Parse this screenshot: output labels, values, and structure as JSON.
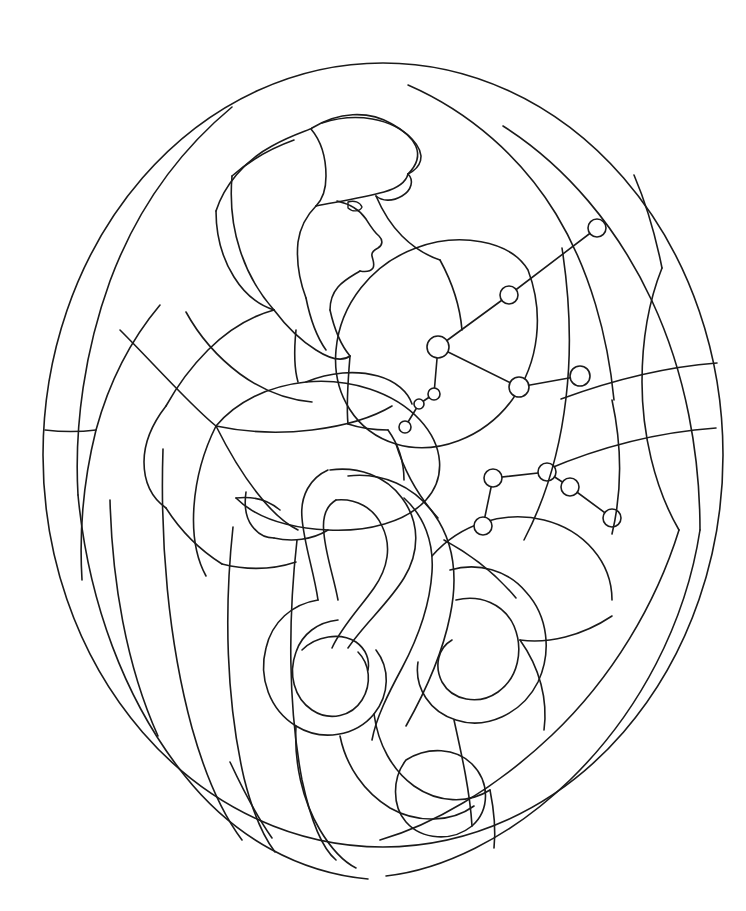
{
  "document": {
    "kind": "line-art-coloring-page",
    "title": "Aquarius Water Bearer Stained Glass Pattern",
    "background_color": "#ffffff",
    "line_color": "#1a1a1a",
    "width": 746,
    "height": 911,
    "subject": "water-bearer-figure-with-constellations"
  },
  "frame": {
    "shape": "oval",
    "center_x": 383,
    "center_y": 455,
    "radius_x": 340,
    "radius_y": 392,
    "left": 43,
    "right": 723,
    "top": 63,
    "bottom": 847,
    "label": "oval-border"
  },
  "figure": {
    "name": "water-bearer",
    "parts": [
      {
        "id": "head-covering",
        "label": "Head covering / cap"
      },
      {
        "id": "face-profile",
        "label": "Face in profile"
      },
      {
        "id": "eye",
        "label": "Eye"
      },
      {
        "id": "hair-back",
        "label": "Hair falling back"
      },
      {
        "id": "shoulder",
        "label": "Shoulder"
      },
      {
        "id": "arm",
        "label": "Arm"
      },
      {
        "id": "torso",
        "label": "Torso / robe"
      },
      {
        "id": "vessel",
        "label": "Water jar / urn"
      },
      {
        "id": "water-stream",
        "label": "Pouring water stream"
      }
    ]
  },
  "constellations": [
    {
      "name": "upper-constellation",
      "label": "Upper constellation",
      "stars": [
        {
          "id": "s1",
          "x": 597,
          "y": 228,
          "r": 9
        },
        {
          "id": "s2",
          "x": 509,
          "y": 295,
          "r": 9
        },
        {
          "id": "s3",
          "x": 438,
          "y": 347,
          "r": 11
        },
        {
          "id": "s4",
          "x": 519,
          "y": 387,
          "r": 10
        },
        {
          "id": "s5",
          "x": 580,
          "y": 376,
          "r": 10
        },
        {
          "id": "s6",
          "x": 434,
          "y": 394,
          "r": 6
        },
        {
          "id": "s7",
          "x": 419,
          "y": 404,
          "r": 5
        },
        {
          "id": "s8",
          "x": 405,
          "y": 427,
          "r": 6
        }
      ],
      "links": [
        [
          "s1",
          "s2"
        ],
        [
          "s2",
          "s3"
        ],
        [
          "s3",
          "s4"
        ],
        [
          "s4",
          "s5"
        ],
        [
          "s3",
          "s6"
        ],
        [
          "s6",
          "s7"
        ],
        [
          "s7",
          "s8"
        ]
      ]
    },
    {
      "name": "lower-constellation",
      "label": "Lower constellation",
      "stars": [
        {
          "id": "t1",
          "x": 493,
          "y": 478,
          "r": 9
        },
        {
          "id": "t2",
          "x": 547,
          "y": 472,
          "r": 9
        },
        {
          "id": "t3",
          "x": 570,
          "y": 487,
          "r": 9
        },
        {
          "id": "t4",
          "x": 612,
          "y": 518,
          "r": 9
        },
        {
          "id": "t5",
          "x": 483,
          "y": 526,
          "r": 9
        }
      ],
      "links": [
        [
          "t1",
          "t2"
        ],
        [
          "t2",
          "t3"
        ],
        [
          "t3",
          "t4"
        ],
        [
          "t1",
          "t5"
        ]
      ]
    }
  ],
  "regions": {
    "background_panels": 14,
    "water_ribbons": 6,
    "total_glass_pieces": 48
  }
}
